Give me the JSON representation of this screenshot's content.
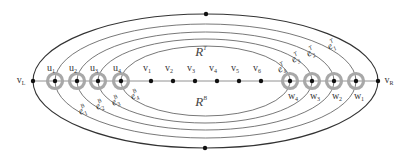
{
  "diagram": {
    "type": "planar-graph",
    "colors": {
      "edge": "#555555",
      "outer_edge": "#333333",
      "spine": "#777777",
      "vertex": "#111111",
      "ring": "#a8a8a8"
    },
    "spine_y": 81,
    "outer_ellipse": {
      "cx": 205.5,
      "cy": 81,
      "rx": 172.5,
      "ry": 67,
      "top_dot": [
        206,
        14
      ],
      "bottom_dot": [
        205,
        148
      ]
    },
    "vertices": [
      {
        "id": "vL",
        "label": "v",
        "sub": "L",
        "x": 33,
        "ringed": false,
        "label_pos": "left"
      },
      {
        "id": "u1",
        "label": "u",
        "sub": "1",
        "x": 55,
        "ringed": true,
        "label_pos": "top"
      },
      {
        "id": "u2",
        "label": "u",
        "sub": "2",
        "x": 77,
        "ringed": true,
        "label_pos": "top"
      },
      {
        "id": "u3",
        "label": "u",
        "sub": "3",
        "x": 98,
        "ringed": true,
        "label_pos": "top"
      },
      {
        "id": "u4",
        "label": "u",
        "sub": "4",
        "x": 121,
        "ringed": true,
        "label_pos": "top"
      },
      {
        "id": "v1",
        "label": "v",
        "sub": "1",
        "x": 151,
        "ringed": false,
        "label_pos": "top"
      },
      {
        "id": "v2",
        "label": "v",
        "sub": "2",
        "x": 173,
        "ringed": false,
        "label_pos": "top"
      },
      {
        "id": "v3",
        "label": "v",
        "sub": "3",
        "x": 195,
        "ringed": false,
        "label_pos": "top"
      },
      {
        "id": "v4",
        "label": "v",
        "sub": "4",
        "x": 217,
        "ringed": false,
        "label_pos": "top"
      },
      {
        "id": "v5",
        "label": "v",
        "sub": "5",
        "x": 239,
        "ringed": false,
        "label_pos": "top"
      },
      {
        "id": "v6",
        "label": "v",
        "sub": "6",
        "x": 261,
        "ringed": false,
        "label_pos": "top"
      },
      {
        "id": "w4",
        "label": "w",
        "sub": "4",
        "x": 290,
        "ringed": true,
        "label_pos": "bottom"
      },
      {
        "id": "w3",
        "label": "w",
        "sub": "3",
        "x": 312,
        "ringed": true,
        "label_pos": "bottom"
      },
      {
        "id": "w2",
        "label": "w",
        "sub": "2",
        "x": 334,
        "ringed": true,
        "label_pos": "bottom"
      },
      {
        "id": "w1",
        "label": "w",
        "sub": "1",
        "x": 356,
        "ringed": true,
        "label_pos": "bottom"
      },
      {
        "id": "vR",
        "label": "v",
        "sub": "R",
        "x": 378,
        "ringed": false,
        "label_pos": "right"
      }
    ],
    "nested_curves": [
      {
        "from": "u1",
        "to": "w1",
        "x1": 55,
        "x2": 356,
        "ry": 57
      },
      {
        "from": "u2",
        "to": "w2",
        "x1": 77,
        "x2": 334,
        "ry": 49
      },
      {
        "from": "u3",
        "to": "w3",
        "x1": 98,
        "x2": 312,
        "ry": 42
      },
      {
        "from": "u4",
        "to": "w4",
        "x1": 121,
        "x2": 290,
        "ry": 35
      }
    ],
    "edge_labels_bottom": [
      {
        "text": "e",
        "sup": "B",
        "sub": "1",
        "x": 84,
        "y": 113
      },
      {
        "text": "e",
        "sup": "B",
        "sub": "2",
        "x": 101,
        "y": 108
      },
      {
        "text": "e",
        "sup": "B",
        "sub": "3",
        "x": 117,
        "y": 104
      },
      {
        "text": "e",
        "sup": "B",
        "sub": "4",
        "x": 136,
        "y": 98
      }
    ],
    "edge_labels_top": [
      {
        "text": "e",
        "sup": "T",
        "sub": "4",
        "x": 283,
        "y": 71
      },
      {
        "text": "e",
        "sup": "T",
        "sub": "3",
        "x": 297,
        "y": 61
      },
      {
        "text": "e",
        "sup": "T",
        "sub": "2",
        "x": 312,
        "y": 55
      },
      {
        "text": "e",
        "sup": "T",
        "sub": "1",
        "x": 333,
        "y": 48
      }
    ],
    "regions": [
      {
        "id": "RT",
        "label": "R",
        "sup": "T",
        "x": 201,
        "y": 56
      },
      {
        "id": "RB",
        "label": "R",
        "sup": "B",
        "x": 201,
        "y": 106
      }
    ]
  }
}
